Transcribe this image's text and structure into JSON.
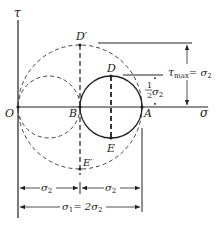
{
  "diagram": {
    "axes": {
      "x_label": "σ",
      "y_label": "τ",
      "origin_label": "O"
    },
    "points": {
      "O": "O",
      "B": "B",
      "A": "A",
      "D": "D",
      "E": "E",
      "D_prime": "D′",
      "E_prime": "E′"
    },
    "circles": [
      {
        "name": "circle-OB",
        "style": "dashed",
        "center_label": "",
        "spans": "O to B"
      },
      {
        "name": "circle-BA",
        "style": "solid",
        "spans": "B to A",
        "top": "D",
        "bottom": "E"
      },
      {
        "name": "circle-OA",
        "style": "dashed",
        "spans": "O to A",
        "top": "D′",
        "bottom": "E′"
      }
    ],
    "annotations": {
      "tau_max": "τ",
      "tau_max_sub": "max",
      "tau_max_eq": "= σ",
      "tau_max_eq_sub": "2",
      "half_num": "1",
      "half_den": "2",
      "half_sigma": "σ",
      "half_sigma_sub": "2"
    },
    "dimensions": {
      "ob": "σ",
      "ob_sub": "2",
      "ba": "σ",
      "ba_sub": "2",
      "total_sigma": "σ",
      "total_sigma_sub": "1",
      "total_eq": "= 2σ",
      "total_eq_sub": "2"
    }
  }
}
